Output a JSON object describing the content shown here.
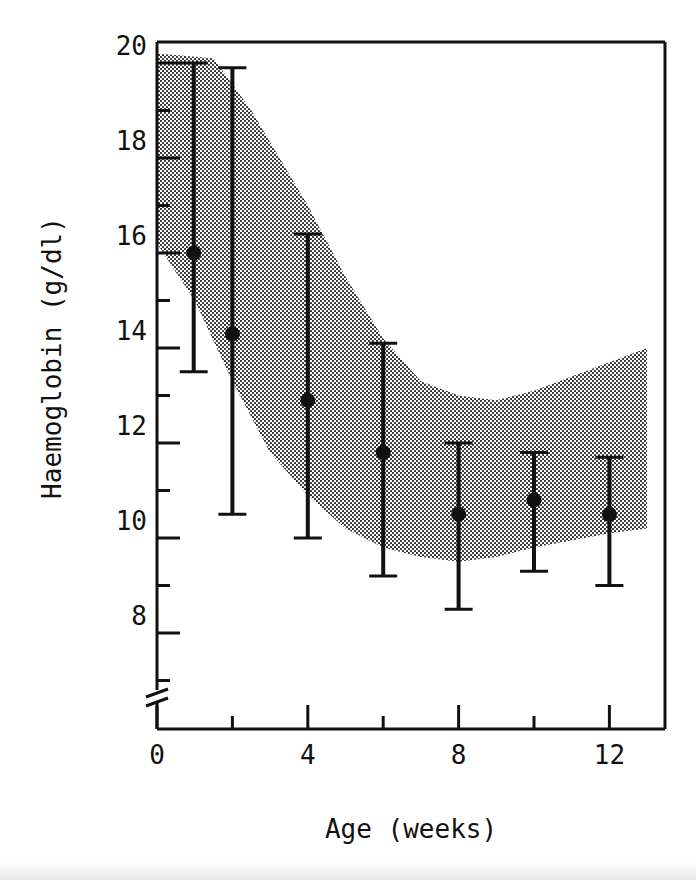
{
  "chart_data": {
    "type": "scatter",
    "title": "",
    "xlabel": "Age (weeks)",
    "ylabel": "Haemoglobin (g/dl)",
    "xlim": [
      0,
      13
    ],
    "ylim": [
      6.5,
      20.5
    ],
    "x_ticks": [
      0,
      4,
      8,
      12
    ],
    "x_minor_ticks": [
      2,
      6,
      10
    ],
    "y_ticks": [
      8,
      10,
      12,
      14,
      16,
      18,
      20
    ],
    "y_minor_ticks": [
      7,
      9,
      11,
      13,
      15,
      17,
      19
    ],
    "y_axis_break": true,
    "grid": false,
    "legend": null,
    "series": [
      {
        "name": "Mean haemoglobin with range",
        "x": [
          1,
          2,
          4,
          6,
          8,
          10,
          12
        ],
        "values": [
          16.0,
          14.3,
          12.9,
          11.8,
          10.5,
          10.8,
          10.5
        ],
        "upper": [
          20.0,
          19.9,
          16.4,
          14.1,
          12.0,
          11.8,
          11.7
        ],
        "lower": [
          13.5,
          10.5,
          10.0,
          9.2,
          8.5,
          9.3,
          9.0
        ]
      }
    ],
    "shaded_band": {
      "name": "Normal range",
      "upper": [
        [
          0,
          20.2
        ],
        [
          1.5,
          20.1
        ],
        [
          2.5,
          19.0
        ],
        [
          4,
          17.0
        ],
        [
          5,
          15.5
        ],
        [
          6,
          14.2
        ],
        [
          7,
          13.3
        ],
        [
          8,
          13.0
        ],
        [
          9,
          12.9
        ],
        [
          10,
          13.1
        ],
        [
          11,
          13.4
        ],
        [
          12,
          13.7
        ],
        [
          13,
          14.0
        ]
      ],
      "lower": [
        [
          0,
          16.2
        ],
        [
          1,
          15.0
        ],
        [
          2,
          13.3
        ],
        [
          3,
          11.8
        ],
        [
          4,
          10.9
        ],
        [
          5,
          10.2
        ],
        [
          6,
          9.8
        ],
        [
          7,
          9.6
        ],
        [
          8,
          9.5
        ],
        [
          9,
          9.6
        ],
        [
          10,
          9.8
        ],
        [
          11,
          9.95
        ],
        [
          12,
          10.1
        ],
        [
          13,
          10.2
        ]
      ]
    }
  },
  "labels": {
    "xlabel": "Age (weeks)",
    "ylabel": "Haemoglobin (g/dl)",
    "x_tick_labels": [
      "0",
      "4",
      "8",
      "12"
    ],
    "y_tick_labels": [
      "8",
      "10",
      "12",
      "14",
      "16",
      "18",
      "20"
    ]
  }
}
